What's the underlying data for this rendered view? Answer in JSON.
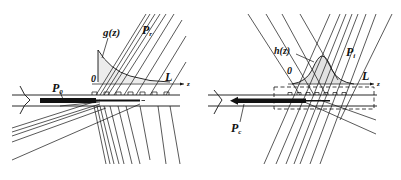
{
  "panels": [
    {
      "id": "left",
      "labels": {
        "profile_function": "g(z)",
        "radiated_power": "P",
        "radiated_power_sub": "r",
        "input_power": "P",
        "input_power_sub": "0",
        "origin": "0",
        "length": "L",
        "axis": "z"
      },
      "description": "Output grating coupler: guided mode P0 leaks out with exponential profile g(z) into radiated beam Pr"
    },
    {
      "id": "right",
      "labels": {
        "profile_function": "h(z)",
        "incident_power": "P",
        "incident_power_sub": "i",
        "coupled_power": "P",
        "coupled_power_sub": "c",
        "origin": "0",
        "length": "L",
        "axis": "z"
      },
      "description": "Input grating coupler: incident beam Pi with Gaussian profile h(z) couples into guided mode Pc"
    }
  ],
  "colors": {
    "ink": "#111111",
    "background": "#ffffff"
  }
}
